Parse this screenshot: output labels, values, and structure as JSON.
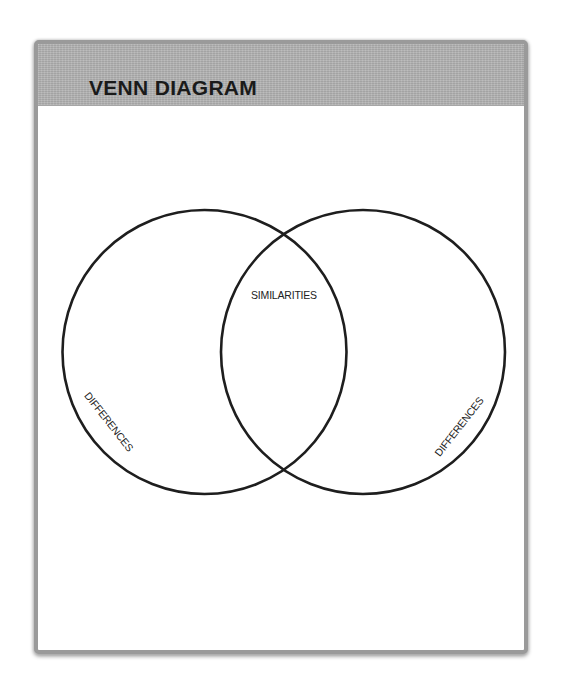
{
  "panel": {
    "title": "VENN DIAGRAM",
    "header_color": "#b3b3b3",
    "border_color": "#9a9a9a"
  },
  "venn": {
    "sets": [
      {
        "id": "left",
        "label": "DIFFERENCES",
        "cx": 204.5,
        "cy": 352,
        "r": 142
      },
      {
        "id": "right",
        "label": "DIFFERENCES",
        "cx": 363,
        "cy": 352,
        "r": 142
      }
    ],
    "intersection": {
      "label": "SIMILARITIES"
    },
    "stroke_color": "#1e1e1e",
    "stroke_width": 2.6
  }
}
